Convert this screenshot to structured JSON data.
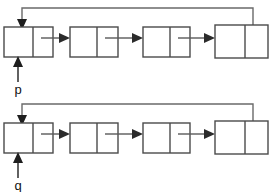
{
  "figure": {
    "background_color": "#ffffff",
    "line_color": "#4a4a4a",
    "arrow_color": "#2b2b2b",
    "label_color": "#111111"
  },
  "lists": [
    {
      "id": "upper-list",
      "pointer_label": "p",
      "node_count": 4,
      "circular": true,
      "nodes": [
        {
          "index": 0,
          "data_cell": "",
          "next_cell": ""
        },
        {
          "index": 1,
          "data_cell": "",
          "next_cell": ""
        },
        {
          "index": 2,
          "data_cell": "",
          "next_cell": ""
        },
        {
          "index": 3,
          "data_cell": "",
          "next_cell": ""
        }
      ]
    },
    {
      "id": "lower-list",
      "pointer_label": "q",
      "node_count": 4,
      "circular": true,
      "nodes": [
        {
          "index": 0,
          "data_cell": "",
          "next_cell": ""
        },
        {
          "index": 1,
          "data_cell": "",
          "next_cell": ""
        },
        {
          "index": 2,
          "data_cell": "",
          "next_cell": ""
        },
        {
          "index": 3,
          "data_cell": "",
          "next_cell": ""
        }
      ]
    }
  ]
}
